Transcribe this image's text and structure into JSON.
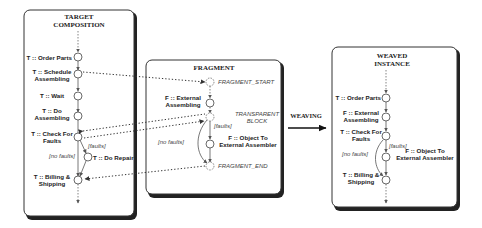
{
  "panels": {
    "target": {
      "title_line1": "TARGET",
      "title_line2": "COMPOSITION",
      "nodes": [
        {
          "label_line1": "T :: Order Parts",
          "label_line2": ""
        },
        {
          "label_line1": "T :: Schedule",
          "label_line2": "Assembling"
        },
        {
          "label_line1": "T :: Wait",
          "label_line2": ""
        },
        {
          "label_line1": "T :: Do",
          "label_line2": "Assembling"
        },
        {
          "label_line1": "T :: Check For",
          "label_line2": "Faults"
        },
        {
          "label_line1": "T :: Do Repair",
          "label_line2": ""
        },
        {
          "label_line1": "T :: Billing &",
          "label_line2": "Shipping"
        }
      ],
      "guards": {
        "faults": "[faults]",
        "no_faults": "[no faults]"
      }
    },
    "fragment": {
      "title": "FRAGMENT",
      "markers": {
        "start": "FRAGMENT_START",
        "transparent_line1": "TRANSPARENT",
        "transparent_line2": "BLOCK",
        "end": "FRAGMENT_END"
      },
      "nodes": [
        {
          "label_line1": "F :: External",
          "label_line2": "Assembling"
        },
        {
          "label_line1": "F :: Object To",
          "label_line2": "External Assembler"
        }
      ],
      "guards": {
        "faults": "[faults]",
        "no_faults": "[no faults]"
      }
    },
    "weaving": {
      "label": "WEAVING"
    },
    "weaved": {
      "title_line1": "WEAVED",
      "title_line2": "INSTANCE",
      "nodes": [
        {
          "label_line1": "T :: Order Parts",
          "label_line2": ""
        },
        {
          "label_line1": "F :: External",
          "label_line2": "Assembling"
        },
        {
          "label_line1": "T :: Check For",
          "label_line2": "Faults"
        },
        {
          "label_line1": "F :: Object To",
          "label_line2": "External Assembler"
        },
        {
          "label_line1": "T :: Billing &",
          "label_line2": "Shipping"
        }
      ],
      "guards": {
        "faults": "[faults]",
        "no_faults": "[no faults]"
      }
    }
  }
}
